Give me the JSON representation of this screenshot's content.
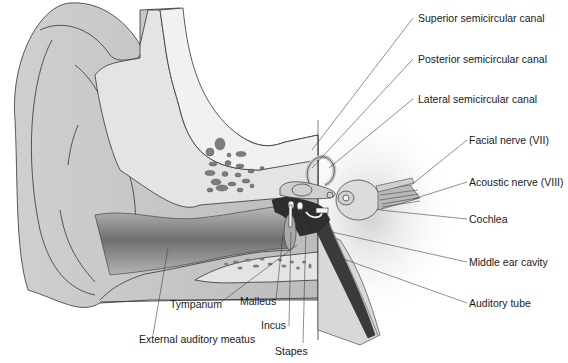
{
  "diagram": {
    "type": "anatomical-illustration",
    "colors": {
      "outer_skin": "#c9c9c9",
      "skin_shadow": "#9a9a9a",
      "bone": "#e6e6e6",
      "bone_spots": "#7d7d7d",
      "dark_tissue": "#2e2e2e",
      "outline": "#333333",
      "leader_line": "#444444",
      "text": "#1a1a1a"
    },
    "labels": {
      "superior_canal": "Superior semicircular canal",
      "posterior_canal": "Posterior semicircular canal",
      "lateral_canal": "Lateral semicircular canal",
      "facial_nerve": "Facial nerve (VII)",
      "acoustic_nerve": "Acoustic nerve (VIII)",
      "cochlea": "Cochlea",
      "middle_ear": "Middle ear cavity",
      "auditory_tube": "Auditory tube",
      "tympanum": "Tympanum",
      "malleus": "Malleus",
      "incus": "Incus",
      "stapes": "Stapes",
      "external_meatus": "External auditory meatus"
    }
  }
}
